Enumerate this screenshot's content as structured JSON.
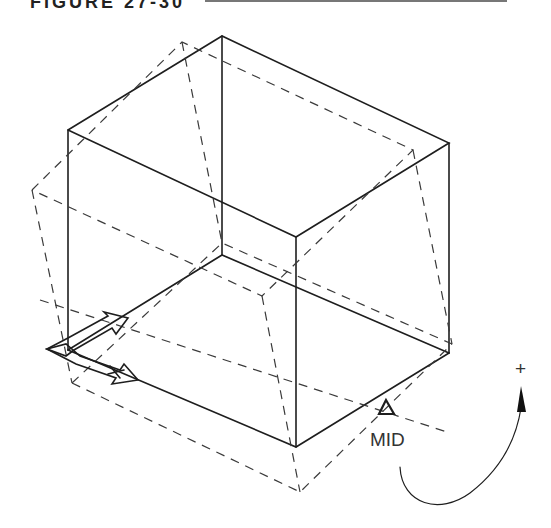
{
  "header": {
    "figure_label": "FIGURE 27-30"
  },
  "diagram": {
    "snap_marker": {
      "label": "MID",
      "icon": "midpoint-triangle-icon"
    },
    "rotation_direction": {
      "sign": "+",
      "icon": "curved-arrow-icon"
    },
    "ucs_icon": "ucs-arrow-icon",
    "colors": {
      "line": "#1e1e1e",
      "dashed": "#3a3a3a",
      "background": "#ffffff"
    }
  }
}
